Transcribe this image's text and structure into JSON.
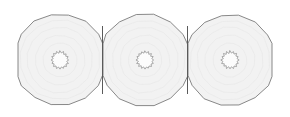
{
  "figure": {
    "background_color": "#ffffff",
    "width": 290,
    "height": 117,
    "style": {
      "cell_fill": "#f2f2f2",
      "cell_stroke": "#6b6b6b",
      "cell_stroke_width": 0.8,
      "core_fill": "#fcfcfc",
      "core_stroke": "#8a8a8a",
      "core_stroke_width": 0.7,
      "texture_stroke": "#e4e4e4",
      "texture_stroke_width": 0.5,
      "divider_stroke": "#5a5a5a",
      "divider_stroke_width": 1.0
    },
    "layout": {
      "cell_count": 3,
      "cell_sides": 16,
      "core_points": 16,
      "centers_x": [
        60,
        145,
        230
      ],
      "center_y": 60,
      "cell_radius": 46,
      "core_outer_radius": 9,
      "core_inner_radius": 7,
      "boundary_x": [
        18,
        103,
        188,
        272
      ],
      "top_y": 13,
      "bottom_y": 107,
      "texture_radii": [
        40,
        33,
        25,
        17
      ]
    },
    "cells": [
      {
        "id": "cell-left",
        "label": "left-cell",
        "center_x": 60,
        "center_y": 60,
        "core_label": "left-core"
      },
      {
        "id": "cell-middle",
        "label": "middle-cell",
        "center_x": 145,
        "center_y": 60,
        "core_label": "middle-core"
      },
      {
        "id": "cell-right",
        "label": "right-cell",
        "center_x": 230,
        "center_y": 60,
        "core_label": "right-core"
      }
    ],
    "dividers": [
      {
        "id": "divider-left-middle",
        "x": 102.5,
        "y_top": 26,
        "y_bottom": 94
      },
      {
        "id": "divider-middle-right",
        "x": 187.5,
        "y_top": 26,
        "y_bottom": 94
      }
    ]
  },
  "chart_data": {
    "type": "diagram",
    "xlabel": "",
    "ylabel": "",
    "categories": [
      "left-cell",
      "middle-cell",
      "right-cell"
    ],
    "values": [
      46,
      46,
      46
    ],
    "annotations": []
  }
}
